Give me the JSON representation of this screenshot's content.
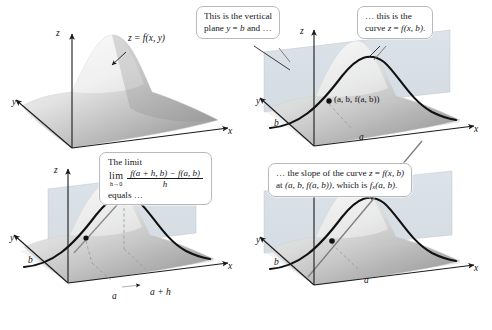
{
  "figure": {
    "background": "#ffffff",
    "ink": "#1a1a1a",
    "plane_color": "#c5cdd6",
    "surface_light": "#f2f2f2",
    "surface_dark": "#9a9a9a",
    "callout_border": "#b9b9bd"
  },
  "callouts": {
    "vertical_plane": {
      "line1": "This is the vertical",
      "line2_pre": "plane ",
      "line2_var": "y",
      "line2_eq": " = ",
      "line2_val": "b",
      "line2_post": " and …"
    },
    "curve": {
      "line1": "… this is the",
      "line2_pre": "curve ",
      "line2_z": "z",
      "line2_eq": " = ",
      "line2_f": "f",
      "line2_args": "(x, b)",
      "line2_post": "."
    },
    "limit": {
      "heading": "The limit",
      "operator": "lim",
      "subscript": "h→0",
      "numerator": "f(a + h, b) − f(a, b)",
      "denominator": "h",
      "trailer": "equals …"
    },
    "slope": {
      "line1_pre": "… the slope of the curve ",
      "line1_z": "z",
      "line1_eq": " = ",
      "line1_f": "f(x, b)",
      "line2_pre": "at ",
      "line2_point": "(a, b, f(a, b))",
      "line2_mid": ", which is ",
      "line2_fx": "f",
      "line2_sub": "x",
      "line2_args": "(a, b)",
      "line2_post": "."
    }
  },
  "panels": [
    {
      "id": "panel-surface",
      "name": "surface-only",
      "axes": {
        "x": "x",
        "y": "y",
        "z": "z"
      },
      "labels": [
        {
          "name": "surface-label",
          "text": "z = f(x, y)"
        }
      ],
      "has_plane": false,
      "has_curve": false,
      "points": [],
      "tick_labels": []
    },
    {
      "id": "panel-plane-curve",
      "name": "vertical-plane-and-trace-curve",
      "axes": {
        "x": "x",
        "y": "y",
        "z": "z"
      },
      "labels": [
        {
          "name": "point-label",
          "text": "(a, b, f(a, b))"
        }
      ],
      "has_plane": true,
      "has_curve": true,
      "points": [
        {
          "name": "point-a-b",
          "label": "(a, b, f(a, b))"
        }
      ],
      "tick_labels": [
        {
          "name": "y-tick-b",
          "text": "b"
        },
        {
          "name": "x-tick-a",
          "text": "a"
        }
      ]
    },
    {
      "id": "panel-secant",
      "name": "secant-line-difference-quotient",
      "axes": {
        "x": "x",
        "y": "y",
        "z": "z"
      },
      "labels": [],
      "has_plane": true,
      "has_curve": true,
      "points": [
        {
          "name": "point-a",
          "label": "a"
        },
        {
          "name": "point-a-plus-h",
          "label": "a + h"
        }
      ],
      "tick_labels": [
        {
          "name": "y-tick-b",
          "text": "b"
        },
        {
          "name": "x-tick-a",
          "text": "a"
        },
        {
          "name": "x-tick-a-plus-h",
          "text": "a + h"
        }
      ]
    },
    {
      "id": "panel-tangent",
      "name": "tangent-line-partial-derivative",
      "axes": {
        "x": "x",
        "y": "y",
        "z": "z"
      },
      "labels": [],
      "has_plane": true,
      "has_curve": true,
      "points": [
        {
          "name": "point-a-b",
          "label": "a"
        }
      ],
      "tick_labels": [
        {
          "name": "y-tick-b",
          "text": "b"
        },
        {
          "name": "x-tick-a",
          "text": "a"
        }
      ]
    }
  ],
  "axis_labels": {
    "x": "x",
    "y": "y",
    "z": "z",
    "b": "b",
    "a": "a",
    "a_plus_h": "a + h"
  },
  "caption": ""
}
